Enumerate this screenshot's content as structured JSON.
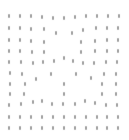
{
  "chart_data": {
    "type": "scatter",
    "title": "",
    "xlabel": "",
    "ylabel": "",
    "grid": false,
    "legend": null,
    "marker_color": "#7a7a7a",
    "xlim": [
      0,
      129
    ],
    "ylim": [
      0,
      140
    ],
    "points": [
      [
        9,
        16
      ],
      [
        20,
        16
      ],
      [
        31,
        16
      ],
      [
        42,
        17
      ],
      [
        53,
        18
      ],
      [
        64,
        18
      ],
      [
        75,
        17
      ],
      [
        86,
        16
      ],
      [
        97,
        16
      ],
      [
        108,
        16
      ],
      [
        119,
        16
      ],
      [
        9,
        28
      ],
      [
        20,
        28
      ],
      [
        31,
        29
      ],
      [
        44,
        29
      ],
      [
        56,
        33
      ],
      [
        72,
        33
      ],
      [
        83,
        30
      ],
      [
        96,
        28
      ],
      [
        107,
        28
      ],
      [
        118,
        28
      ],
      [
        9,
        40
      ],
      [
        20,
        40
      ],
      [
        31,
        41
      ],
      [
        44,
        42
      ],
      [
        81,
        42
      ],
      [
        95,
        41
      ],
      [
        107,
        40
      ],
      [
        118,
        40
      ],
      [
        9,
        51
      ],
      [
        20,
        51
      ],
      [
        32,
        52
      ],
      [
        44,
        52
      ],
      [
        81,
        52
      ],
      [
        95,
        51
      ],
      [
        107,
        51
      ],
      [
        118,
        51
      ],
      [
        9,
        62
      ],
      [
        21,
        62
      ],
      [
        33,
        63
      ],
      [
        43,
        62
      ],
      [
        54,
        61
      ],
      [
        64,
        58
      ],
      [
        73,
        61
      ],
      [
        83,
        63
      ],
      [
        94,
        63
      ],
      [
        106,
        62
      ],
      [
        117,
        62
      ],
      [
        10,
        73
      ],
      [
        22,
        74
      ],
      [
        36,
        79
      ],
      [
        51,
        74
      ],
      [
        76,
        74
      ],
      [
        91,
        78
      ],
      [
        104,
        74
      ],
      [
        116,
        74
      ],
      [
        10,
        84
      ],
      [
        25,
        84
      ],
      [
        64,
        84
      ],
      [
        102,
        84
      ],
      [
        116,
        84
      ],
      [
        10,
        94
      ],
      [
        24,
        94
      ],
      [
        64,
        94
      ],
      [
        102,
        94
      ],
      [
        116,
        94
      ],
      [
        9,
        105
      ],
      [
        21,
        104
      ],
      [
        33,
        102
      ],
      [
        42,
        101
      ],
      [
        52,
        104
      ],
      [
        63,
        104
      ],
      [
        75,
        104
      ],
      [
        85,
        101
      ],
      [
        95,
        103
      ],
      [
        106,
        105
      ],
      [
        117,
        105
      ],
      [
        9,
        117
      ],
      [
        20,
        117
      ],
      [
        31,
        117
      ],
      [
        42,
        117
      ],
      [
        53,
        117
      ],
      [
        64,
        117
      ],
      [
        75,
        117
      ],
      [
        86,
        117
      ],
      [
        97,
        117
      ],
      [
        107,
        117
      ],
      [
        118,
        117
      ],
      [
        9,
        128
      ],
      [
        20,
        128
      ],
      [
        31,
        128
      ],
      [
        42,
        128
      ],
      [
        53,
        128
      ],
      [
        64,
        128
      ],
      [
        75,
        128
      ],
      [
        86,
        128
      ],
      [
        97,
        128
      ],
      [
        107,
        128
      ],
      [
        118,
        128
      ]
    ]
  }
}
